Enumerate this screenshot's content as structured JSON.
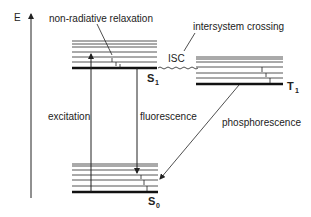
{
  "diagram": {
    "type": "Jablonski diagram",
    "axis_label": "E",
    "states": {
      "S1": {
        "label": "S",
        "sub": "1"
      },
      "T1": {
        "label": "T",
        "sub": "1"
      },
      "S0": {
        "label": "S",
        "sub": "0"
      }
    },
    "labels": {
      "non_radiative": "non-radiative relaxation",
      "intersystem": "intersystem crossing",
      "isc": "ISC",
      "excitation": "excitation",
      "fluorescence": "fluorescence",
      "phosphorescence": "phosphorescence"
    },
    "colors": {
      "line": "#222222",
      "thin_level": "#555555"
    }
  }
}
